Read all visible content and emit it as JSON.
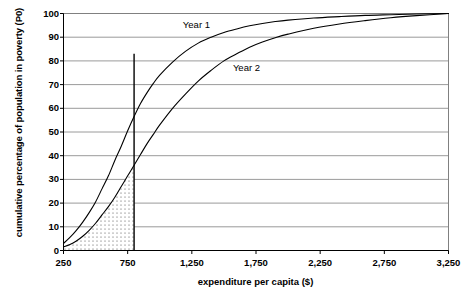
{
  "chart_data": {
    "type": "line",
    "title": "",
    "xlabel": "expenditure per capita ($)",
    "ylabel": "cumulative percentage of population in poverty (P0)",
    "xlim": [
      250,
      3250
    ],
    "ylim": [
      0,
      100
    ],
    "grid": true,
    "gridlines": "horizontal",
    "legend_position": "inline-annotation",
    "xticks": [
      250,
      750,
      1250,
      1750,
      2250,
      2750,
      3250
    ],
    "xticklabels": [
      "250",
      "750",
      "1,250",
      "1,750",
      "2,250",
      "2,750",
      "3,250"
    ],
    "yticks": [
      0,
      10,
      20,
      30,
      40,
      50,
      60,
      70,
      80,
      90,
      100
    ],
    "yticklabels": [
      "0",
      "10",
      "20",
      "30",
      "40",
      "50",
      "60",
      "70",
      "80",
      "90",
      "100"
    ],
    "series": [
      {
        "name": "Year 1",
        "label_x": 1180,
        "label_y": 95,
        "color": "#000000",
        "x": [
          250,
          300,
          350,
          400,
          450,
          500,
          550,
          600,
          650,
          700,
          750,
          800,
          850,
          900,
          950,
          1000,
          1100,
          1200,
          1300,
          1400,
          1500,
          1600,
          1700,
          1800,
          1900,
          2000,
          2200,
          2400,
          2600,
          2800,
          3000,
          3250
        ],
        "y": [
          3,
          5.5,
          8.5,
          12,
          16,
          20.5,
          26,
          31.5,
          38,
          44,
          50.5,
          56.5,
          62,
          66.5,
          70.5,
          74,
          79.5,
          84,
          87.5,
          90,
          92,
          93.5,
          94.8,
          95.8,
          96.6,
          97.2,
          98.1,
          98.7,
          99.2,
          99.5,
          99.8,
          100
        ]
      },
      {
        "name": "Year 2",
        "label_x": 1570,
        "label_y": 77,
        "color": "#000000",
        "x": [
          250,
          300,
          350,
          400,
          450,
          500,
          550,
          600,
          650,
          700,
          750,
          800,
          850,
          900,
          950,
          1000,
          1100,
          1200,
          1300,
          1400,
          1500,
          1600,
          1700,
          1800,
          1900,
          2000,
          2200,
          2400,
          2600,
          2800,
          3000,
          3250
        ],
        "y": [
          1.5,
          2.5,
          4,
          6,
          8.5,
          11.5,
          15,
          18.5,
          22.5,
          27,
          31.5,
          36,
          40.5,
          45,
          49,
          53,
          60,
          66,
          71.5,
          76,
          80,
          83,
          85.8,
          88,
          89.8,
          91.3,
          93.8,
          95.6,
          97,
          98.2,
          99.1,
          100
        ]
      }
    ],
    "annotations": [
      {
        "name": "poverty-line",
        "type": "vline",
        "x": 800,
        "y_from": 0,
        "y_to": 83,
        "color": "#000000"
      },
      {
        "name": "shaded-poverty-gap-area",
        "type": "dotted-fill",
        "description": "dotted region between Year 2 curve, x-axis and the poverty line",
        "x_from": 250,
        "x_to": 800,
        "color": "#000000"
      }
    ]
  },
  "axis": {
    "y_title": "cumulative percentage of population in poverty (P0)",
    "x_title": "expenditure per capita ($)"
  },
  "labels": {
    "series1": "Year 1",
    "series2": "Year 2"
  }
}
